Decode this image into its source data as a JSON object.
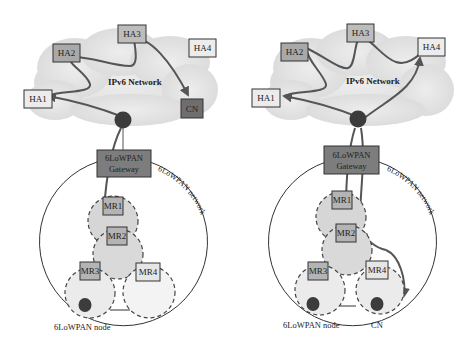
{
  "colors": {
    "cloud": "#e3e3e3",
    "ha_light": "#ececec",
    "ha_dark": "#a9a9a9",
    "cn_dark": "#6e6e6e",
    "router": "#3c3c3c",
    "gateway": "#7d7d7d",
    "mr_fill": "#b4b4b4",
    "mr4_fill": "#e6e6e6",
    "zone_fill": "#d6d6d6",
    "zone_light": "#ebebeb",
    "path": "#555555",
    "outline": "#333333"
  },
  "panels": [
    {
      "id": "left",
      "network_label": "IPv6 Network",
      "home_agents": [
        {
          "label": "HA1",
          "style": "light"
        },
        {
          "label": "HA2",
          "style": "dark"
        },
        {
          "label": "HA3",
          "style": "dark"
        },
        {
          "label": "HA4",
          "style": "light"
        }
      ],
      "correspondent": {
        "label": "CN",
        "location": "IPv6 network"
      },
      "gateway": {
        "line1": "6LoWPAN",
        "line2": "Gateway"
      },
      "lowpan_network_label": "6LoWPAN network",
      "mobile_routers": [
        "MR1",
        "MR2",
        "MR3",
        "MR4"
      ],
      "node_label": "6LoWPAN node"
    },
    {
      "id": "right",
      "network_label": "IPv6 Network",
      "home_agents": [
        {
          "label": "HA1",
          "style": "light"
        },
        {
          "label": "HA2",
          "style": "dark"
        },
        {
          "label": "HA3",
          "style": "dark"
        },
        {
          "label": "HA4",
          "style": "light"
        }
      ],
      "correspondent": {
        "label": "CN",
        "location": "6LoWPAN network"
      },
      "gateway": {
        "line1": "6LoWPAN",
        "line2": "Gateway"
      },
      "lowpan_network_label": "6LoWPAN network",
      "mobile_routers": [
        "MR1",
        "MR2",
        "MR3",
        "MR4"
      ],
      "node_label": "6LoWPAN node"
    }
  ]
}
